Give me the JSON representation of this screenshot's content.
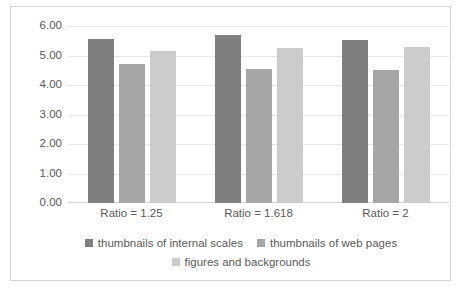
{
  "chart_data": {
    "type": "bar",
    "title": "",
    "xlabel": "",
    "ylabel": "",
    "categories": [
      "Ratio = 1.25",
      "Ratio = 1.618",
      "Ratio = 2"
    ],
    "series": [
      {
        "name": "thumbnails of internal scales",
        "color": "#7f7f7f",
        "values": [
          5.55,
          5.68,
          5.52
        ]
      },
      {
        "name": "thumbnails of web pages",
        "color": "#a6a6a6",
        "values": [
          4.7,
          4.55,
          4.5
        ]
      },
      {
        "name": "figures and backgrounds",
        "color": "#cccccc",
        "values": [
          5.15,
          5.25,
          5.28
        ]
      }
    ],
    "ylim": [
      0,
      6
    ],
    "ytick_labels": [
      "6.00",
      "5.00",
      "4.00",
      "3.00",
      "2.00",
      "1.00",
      "0.00"
    ],
    "ytick_values": [
      6,
      5,
      4,
      3,
      2,
      1,
      0
    ],
    "grid": true,
    "legend_position": "bottom",
    "axis_text_color": "#595959",
    "gridline_color": "#e8e8e8",
    "border_color": "#d6d6d6",
    "plot_background": "#ffffff"
  }
}
